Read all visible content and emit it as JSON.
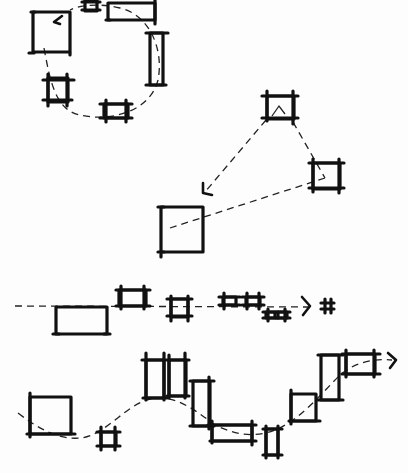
{
  "diagram": {
    "type": "hand-drawn sketch",
    "stroke_color": "#111111",
    "background_color": "#fdfdfd",
    "groups": [
      {
        "name": "circular-sequence",
        "path": "dashed loop (circular)",
        "frames": [
          {
            "x": 32,
            "y": 12,
            "w": 38,
            "h": 40
          },
          {
            "x": 84,
            "y": 0,
            "w": 12,
            "h": 10
          },
          {
            "x": 107,
            "y": 2,
            "w": 48,
            "h": 18
          },
          {
            "x": 150,
            "y": 33,
            "w": 13,
            "h": 52
          },
          {
            "x": 47,
            "y": 78,
            "w": 22,
            "h": 24
          },
          {
            "x": 104,
            "y": 102,
            "w": 24,
            "h": 17
          }
        ]
      },
      {
        "name": "triangular-sequence",
        "path": "dashed triangle with arrow",
        "frames": [
          {
            "x": 266,
            "y": 95,
            "w": 28,
            "h": 24
          },
          {
            "x": 312,
            "y": 162,
            "w": 28,
            "h": 27
          },
          {
            "x": 160,
            "y": 206,
            "w": 43,
            "h": 46
          }
        ]
      },
      {
        "name": "linear-sequence",
        "path": "dashed horizontal line with arrow",
        "frames": [
          {
            "x": 55,
            "y": 306,
            "w": 52,
            "h": 28
          },
          {
            "x": 119,
            "y": 289,
            "w": 28,
            "h": 17
          },
          {
            "x": 170,
            "y": 298,
            "w": 18,
            "h": 20
          },
          {
            "x": 222,
            "y": 295,
            "w": 14,
            "h": 10
          },
          {
            "x": 245,
            "y": 295,
            "w": 16,
            "h": 10
          },
          {
            "x": 265,
            "y": 311,
            "w": 10,
            "h": 7
          },
          {
            "x": 277,
            "y": 311,
            "w": 10,
            "h": 7
          },
          {
            "x": 323,
            "y": 302,
            "w": 8,
            "h": 8
          }
        ]
      },
      {
        "name": "wave-sequence",
        "path": "dashed sinusoidal curve with arrow",
        "frames": [
          {
            "x": 30,
            "y": 397,
            "w": 42,
            "h": 37
          },
          {
            "x": 101,
            "y": 432,
            "w": 16,
            "h": 15
          },
          {
            "x": 146,
            "y": 355,
            "w": 18,
            "h": 42
          },
          {
            "x": 169,
            "y": 357,
            "w": 17,
            "h": 38
          },
          {
            "x": 193,
            "y": 380,
            "w": 17,
            "h": 46
          },
          {
            "x": 212,
            "y": 424,
            "w": 40,
            "h": 17
          },
          {
            "x": 266,
            "y": 428,
            "w": 13,
            "h": 27
          },
          {
            "x": 291,
            "y": 393,
            "w": 26,
            "h": 29
          },
          {
            "x": 321,
            "y": 355,
            "w": 18,
            "h": 46
          },
          {
            "x": 346,
            "y": 353,
            "w": 30,
            "h": 21
          }
        ]
      }
    ]
  }
}
